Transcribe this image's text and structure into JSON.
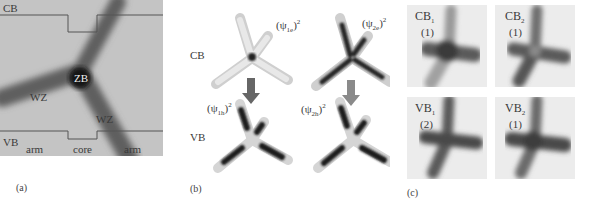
{
  "figure": {
    "panels": [
      {
        "id": "a",
        "label": "(a)",
        "band_labels": {
          "top": "CB",
          "bottom": "VB"
        },
        "region_labels": {
          "core": "ZB",
          "arm_left": "WZ",
          "arm_right": "WZ"
        },
        "axis_labels": [
          "arm",
          "core",
          "arm"
        ],
        "colors": {
          "background": "#c4c4c4",
          "tetrapod": "#5a5a5a",
          "core": "#151515",
          "band_line": "#555555"
        }
      },
      {
        "id": "b",
        "label": "(b)",
        "row_labels": [
          "CB",
          "VB"
        ],
        "states": {
          "psi1e": {
            "base": "(ψ",
            "sub": "1e",
            "close": ")",
            "sup": "2"
          },
          "psi2e": {
            "base": "(ψ",
            "sub": "2e",
            "close": ")",
            "sup": "2"
          },
          "psi1h": {
            "base": "(ψ",
            "sub": "1h",
            "close": ")",
            "sup": "2"
          },
          "psi2h": {
            "base": "(ψ",
            "sub": "2h",
            "close": ")",
            "sup": "2"
          }
        },
        "colors": {
          "arrow_left": "#666666",
          "arrow_right": "#8a8a8a",
          "density": "#2a2a2a",
          "shell": "#d8d8d8"
        }
      },
      {
        "id": "c",
        "label": "(c)",
        "tiles": [
          {
            "name": "CB",
            "sub": "1",
            "degeneracy": "(1)"
          },
          {
            "name": "CB",
            "sub": "2",
            "degeneracy": "(1)"
          },
          {
            "name": "VB",
            "sub": "1",
            "degeneracy": "(2)"
          },
          {
            "name": "VB",
            "sub": "2",
            "degeneracy": "(1)"
          }
        ],
        "colors": {
          "background": "#ececec",
          "density": "#4a4a4a"
        }
      }
    ]
  }
}
